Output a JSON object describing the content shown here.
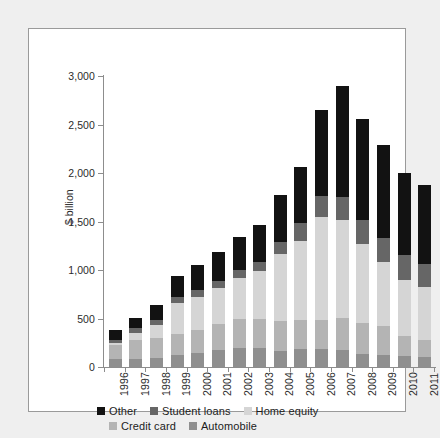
{
  "chart_data": {
    "type": "bar",
    "subtype": "stacked-vertical",
    "title": "",
    "xlabel": "",
    "ylabel": "$ billion",
    "ylim": [
      0,
      3000
    ],
    "yticks": [
      "0",
      "500",
      "1,000",
      "1,500",
      "2,000",
      "2,500",
      "3,000"
    ],
    "ytick_values": [
      0,
      500,
      1000,
      1500,
      2000,
      2500,
      3000
    ],
    "grid": false,
    "legend_position": "bottom-left",
    "categories": [
      "1996",
      "1997",
      "1998",
      "1999",
      "2000",
      "2001",
      "2002",
      "2003",
      "2004",
      "2005",
      "2006",
      "2007",
      "2008",
      "2009",
      "2010",
      "2011"
    ],
    "series": [
      {
        "name": "Automobile",
        "color": "#8f8f8f",
        "values": [
          80,
          85,
          95,
          120,
          145,
          175,
          195,
          195,
          170,
          190,
          185,
          180,
          130,
          125,
          110,
          105
        ]
      },
      {
        "name": "Credit card",
        "color": "#b4b4b4",
        "values": [
          150,
          195,
          200,
          220,
          240,
          265,
          295,
          305,
          305,
          290,
          295,
          330,
          325,
          300,
          215,
          175
        ]
      },
      {
        "name": "Home equity",
        "color": "#d5d5d5",
        "values": [
          20,
          75,
          140,
          325,
          340,
          370,
          430,
          485,
          695,
          820,
          1070,
          1010,
          810,
          660,
          575,
          545
        ]
      },
      {
        "name": "Student loans",
        "color": "#666666",
        "values": [
          30,
          45,
          50,
          55,
          65,
          75,
          85,
          100,
          120,
          180,
          215,
          230,
          250,
          245,
          250,
          235
        ]
      },
      {
        "name": "Other",
        "color": "#121212",
        "values": [
          105,
          105,
          155,
          215,
          265,
          305,
          340,
          375,
          480,
          585,
          885,
          1150,
          1040,
          960,
          855,
          815
        ]
      }
    ],
    "totals": [
      385,
      505,
      640,
      935,
      1055,
      1190,
      1345,
      1460,
      1770,
      2065,
      2650,
      2900,
      2555,
      2290,
      2005,
      1875
    ]
  },
  "axis": {
    "y_title": "$ billion"
  },
  "legend": {
    "rows": [
      [
        {
          "label": "Other",
          "swatch": "legend-swatch-other"
        },
        {
          "label": "Student loans",
          "swatch": "legend-swatch-student-loans"
        },
        {
          "label": "Home equity",
          "swatch": "legend-swatch-home-equity"
        }
      ],
      [
        {
          "label": "Credit card",
          "swatch": "legend-swatch-credit-card"
        },
        {
          "label": "Automobile",
          "swatch": "legend-swatch-automobile"
        }
      ]
    ]
  },
  "colors": {
    "other": "#121212",
    "student_loans": "#666666",
    "home_equity": "#d5d5d5",
    "credit_card": "#b4b4b4",
    "automobile": "#8f8f8f",
    "frame": "#9a9a9a",
    "page_background": "#efefef",
    "plot_background": "#ffffff"
  }
}
